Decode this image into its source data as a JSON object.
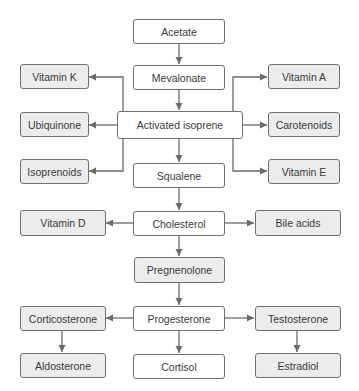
{
  "diagram": {
    "title": "",
    "colors": {
      "line": "#6a6a6a",
      "border": "#6f6f6f",
      "central_fill": "#ffffff",
      "side_fill": "#ececec",
      "text": "#3a3a3a"
    },
    "nodes": {
      "acetate": {
        "label": "Acetate",
        "fill": "white"
      },
      "mevalonate": {
        "label": "Mevalonate",
        "fill": "white"
      },
      "activated_isoprene": {
        "label": "Activated isoprene",
        "fill": "white"
      },
      "squalene": {
        "label": "Squalene",
        "fill": "white"
      },
      "cholesterol": {
        "label": "Cholesterol",
        "fill": "white"
      },
      "pregnenolone": {
        "label": "Pregnenolone",
        "fill": "gray"
      },
      "progesterone": {
        "label": "Progesterone",
        "fill": "white"
      },
      "cortisol": {
        "label": "Cortisol",
        "fill": "white"
      },
      "vitamin_k": {
        "label": "Vitamin K",
        "fill": "gray"
      },
      "ubiquinone": {
        "label": "Ubiquinone",
        "fill": "gray"
      },
      "isoprenoids": {
        "label": "Isoprenoids",
        "fill": "gray"
      },
      "vitamin_a": {
        "label": "Vitamin A",
        "fill": "gray"
      },
      "carotenoids": {
        "label": "Carotenoids",
        "fill": "gray"
      },
      "vitamin_e": {
        "label": "Vitamin E",
        "fill": "gray"
      },
      "vitamin_d": {
        "label": "Vitamin D",
        "fill": "gray"
      },
      "bile_acids": {
        "label": "Bile acids",
        "fill": "gray"
      },
      "corticosterone": {
        "label": "Corticosterone",
        "fill": "gray"
      },
      "aldosterone": {
        "label": "Aldosterone",
        "fill": "gray"
      },
      "testosterone": {
        "label": "Testosterone",
        "fill": "gray"
      },
      "estradiol": {
        "label": "Estradiol",
        "fill": "gray"
      }
    },
    "edges": [
      [
        "Acetate",
        "Mevalonate"
      ],
      [
        "Mevalonate",
        "Activated isoprene"
      ],
      [
        "Activated isoprene",
        "Vitamin K"
      ],
      [
        "Activated isoprene",
        "Ubiquinone"
      ],
      [
        "Activated isoprene",
        "Isoprenoids"
      ],
      [
        "Activated isoprene",
        "Vitamin A"
      ],
      [
        "Activated isoprene",
        "Carotenoids"
      ],
      [
        "Activated isoprene",
        "Vitamin E"
      ],
      [
        "Activated isoprene",
        "Squalene"
      ],
      [
        "Squalene",
        "Cholesterol"
      ],
      [
        "Cholesterol",
        "Vitamin D"
      ],
      [
        "Cholesterol",
        "Bile acids"
      ],
      [
        "Cholesterol",
        "Pregnenolone"
      ],
      [
        "Pregnenolone",
        "Progesterone"
      ],
      [
        "Progesterone",
        "Corticosterone"
      ],
      [
        "Progesterone",
        "Testosterone"
      ],
      [
        "Progesterone",
        "Cortisol"
      ],
      [
        "Corticosterone",
        "Aldosterone"
      ],
      [
        "Testosterone",
        "Estradiol"
      ]
    ]
  }
}
